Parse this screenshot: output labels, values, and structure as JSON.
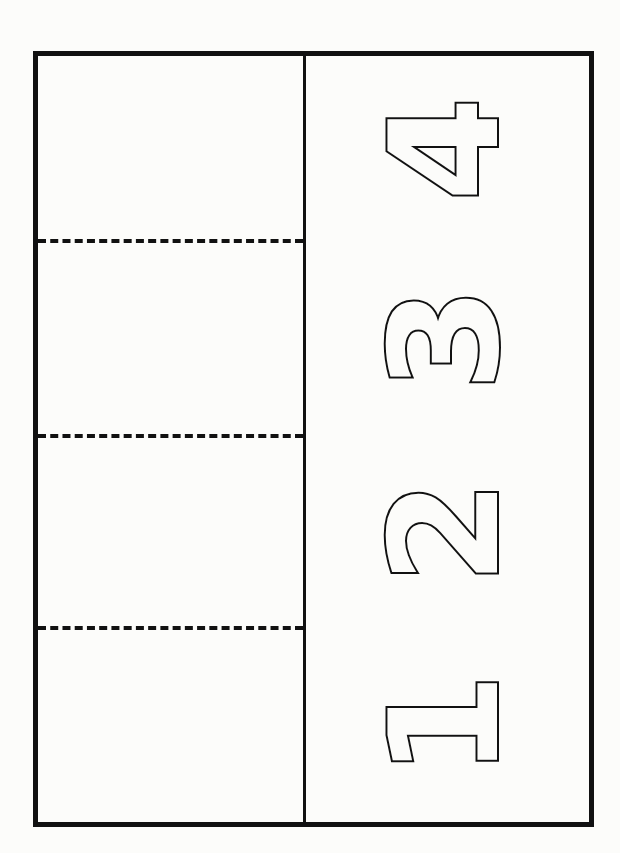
{
  "worksheet": {
    "type": "number cut-and-fold template",
    "panels": 4,
    "numbers": [
      {
        "label": "4",
        "center_y": 140
      },
      {
        "label": "3",
        "center_y": 335
      },
      {
        "label": "2",
        "center_y": 525
      },
      {
        "label": "1",
        "center_y": 715
      }
    ],
    "fold_lines_y": [
      241,
      436,
      628
    ],
    "colors": {
      "ink": "#111111",
      "paper": "#fcfcfa"
    }
  }
}
